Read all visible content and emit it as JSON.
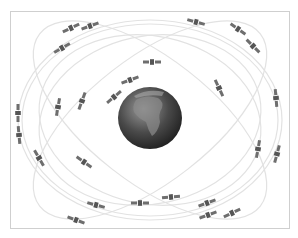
{
  "diagram": {
    "colors": {
      "background": "#ffffff",
      "frame": "#cfcfcf",
      "orbit": "#e2e2e2",
      "satellite": "#6e6e6e",
      "earth_dark": "#2a2a2a",
      "earth_light": "#9a9a9a"
    },
    "earth": {
      "cx": 150,
      "cy": 118,
      "rx": 32,
      "ry": 31
    },
    "orbits": [
      {
        "cx": 150,
        "cy": 120,
        "rx": 132,
        "ry": 100,
        "rot": 0
      },
      {
        "cx": 150,
        "cy": 120,
        "rx": 128,
        "ry": 96,
        "rot": 0
      },
      {
        "cx": 150,
        "cy": 120,
        "rx": 140,
        "ry": 62,
        "rot": 38
      },
      {
        "cx": 150,
        "cy": 120,
        "rx": 140,
        "ry": 62,
        "rot": -38
      },
      {
        "cx": 150,
        "cy": 120,
        "rx": 112,
        "ry": 84,
        "rot": 12
      },
      {
        "cx": 150,
        "cy": 120,
        "rx": 112,
        "ry": 84,
        "rot": -12
      }
    ],
    "satellites": [
      {
        "x": 71,
        "y": 28,
        "a": -25
      },
      {
        "x": 90,
        "y": 26,
        "a": -20
      },
      {
        "x": 62,
        "y": 48,
        "a": -30
      },
      {
        "x": 196,
        "y": 22,
        "a": 15
      },
      {
        "x": 238,
        "y": 29,
        "a": 35
      },
      {
        "x": 253,
        "y": 46,
        "a": 45
      },
      {
        "x": 152,
        "y": 62,
        "a": 0
      },
      {
        "x": 130,
        "y": 80,
        "a": -20
      },
      {
        "x": 114,
        "y": 97,
        "a": -40
      },
      {
        "x": 82,
        "y": 101,
        "a": -70
      },
      {
        "x": 58,
        "y": 107,
        "a": -80
      },
      {
        "x": 219,
        "y": 88,
        "a": 65
      },
      {
        "x": 276,
        "y": 98,
        "a": 85
      },
      {
        "x": 18,
        "y": 113,
        "a": 90
      },
      {
        "x": 19,
        "y": 135,
        "a": 85
      },
      {
        "x": 39,
        "y": 158,
        "a": 60
      },
      {
        "x": 84,
        "y": 162,
        "a": 35
      },
      {
        "x": 258,
        "y": 149,
        "a": -80
      },
      {
        "x": 277,
        "y": 154,
        "a": -75
      },
      {
        "x": 96,
        "y": 205,
        "a": 15
      },
      {
        "x": 76,
        "y": 220,
        "a": 20
      },
      {
        "x": 140,
        "y": 203,
        "a": 0
      },
      {
        "x": 171,
        "y": 197,
        "a": -5
      },
      {
        "x": 207,
        "y": 203,
        "a": -20
      },
      {
        "x": 208,
        "y": 215,
        "a": -20
      },
      {
        "x": 232,
        "y": 213,
        "a": -25
      }
    ]
  }
}
